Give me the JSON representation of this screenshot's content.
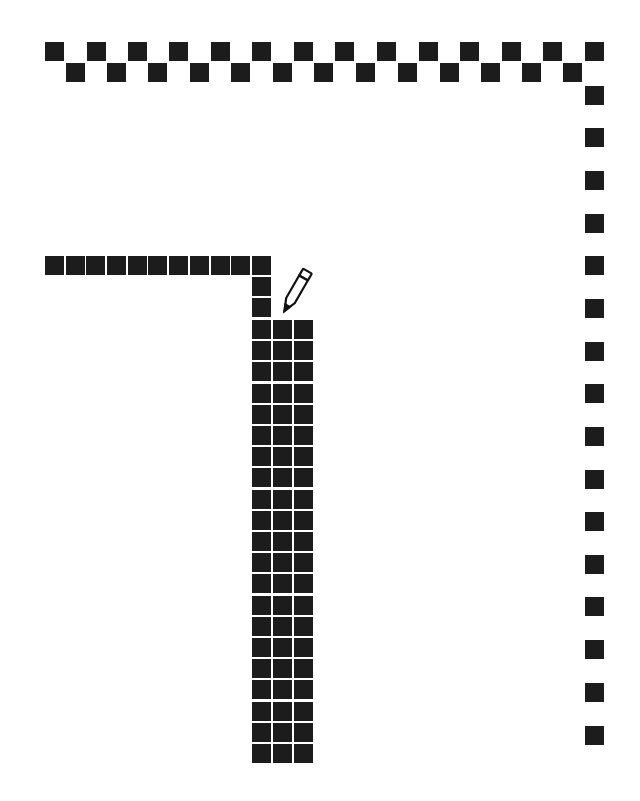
{
  "canvas": {
    "background": "#ffffff",
    "cell_color": "#1c1c1c",
    "cell_size": 19
  },
  "tool": {
    "cursor": "pencil-icon",
    "position": {
      "x": 284,
      "y": 310
    }
  },
  "shapes": {
    "top_border_row1": {
      "y": 42,
      "xs": [
        45,
        87,
        128,
        169,
        211,
        252,
        294,
        335,
        377,
        419,
        460,
        502,
        543,
        585
      ]
    },
    "top_border_row2": {
      "y": 63,
      "xs": [
        66,
        107,
        148,
        190,
        231,
        273,
        314,
        356,
        398,
        440,
        481,
        522,
        563
      ]
    },
    "right_border_column": {
      "x": 585,
      "ys": [
        86,
        128,
        171,
        214,
        256,
        299,
        342,
        384,
        427,
        470,
        512,
        555,
        597,
        640,
        683,
        726
      ]
    },
    "horizontal_line": {
      "y": 256,
      "xs": [
        45,
        66,
        86,
        107,
        128,
        148,
        169,
        190,
        211,
        231,
        252
      ]
    },
    "vertical_stub": {
      "x": 252,
      "ys": [
        277,
        298
      ]
    },
    "thick_column": {
      "xs": [
        252,
        273,
        294
      ],
      "y_start": 320,
      "rows": 21,
      "pitch": 21.2
    }
  }
}
